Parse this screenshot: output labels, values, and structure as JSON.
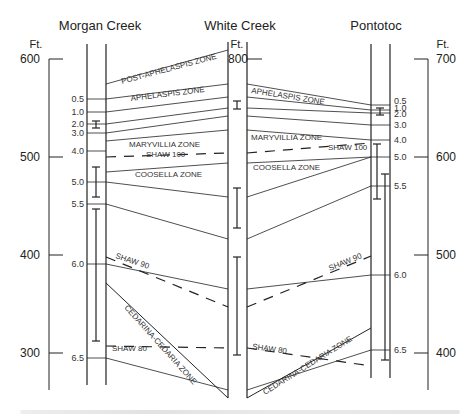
{
  "sections": [
    {
      "id": "morgan",
      "title": "Morgan Creek",
      "unit": "Ft."
    },
    {
      "id": "white",
      "title": "White Creek",
      "unit": "Ft."
    },
    {
      "id": "pontotoc",
      "title": "Pontotoc",
      "unit": "Ft."
    }
  ],
  "scales": {
    "left": {
      "unit": "Ft.",
      "ticks": [
        "600",
        "500",
        "400",
        "300"
      ]
    },
    "white": {
      "top_label": "800"
    },
    "right": {
      "unit": "Ft.",
      "ticks": [
        "700",
        "600",
        "500",
        "400"
      ]
    }
  },
  "markers": {
    "morgan": [
      "0.5",
      "1.0",
      "2.0",
      "3.0",
      "4.0",
      "5.0",
      "5.5",
      "6.0",
      "6.5"
    ],
    "pontotoc": [
      "0.5",
      "1.0",
      "2.0",
      "3.0",
      "4.0",
      "5.0",
      "5.5",
      "6.0",
      "6.5"
    ]
  },
  "zones": {
    "post_aphelaspis": "POST-APHELASPIS ZONE",
    "aphelaspis_left": "APHELASPIS ZONE",
    "aphelaspis_right": "APHELASPIS ZONE",
    "maryvillia_left": "MARYVILLIA ZONE",
    "maryvillia_right": "MARYVILLIA ZONE",
    "shaw100_left": "SHAW 100",
    "shaw100_right": "SHAW 100",
    "coosella_left": "COOSELLA ZONE",
    "coosella_right": "COOSELLA ZONE",
    "shaw90_left": "SHAW 90",
    "shaw90_right": "SHAW 90",
    "cedarina_left": "CEDARINA-CEDARIA ZONE",
    "cedarina_right": "CEDARINA-CEDARIA ZONE",
    "shaw80_left": "SHAW 80",
    "shaw80_right": "SHAW 80"
  }
}
